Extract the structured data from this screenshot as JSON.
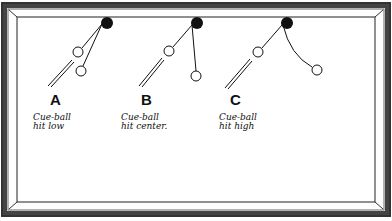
{
  "diagram": {
    "colors": {
      "ink": "#111111",
      "frame": "#555555",
      "cloth": "#ffffff"
    },
    "panels": [
      {
        "letter": "A",
        "caption_line1": "Cue-ball",
        "caption_line2": "hit low",
        "object_ball": [
          107,
          23
        ],
        "cue_ball_contact": [
          78,
          52
        ],
        "cue_ball_end": [
          81,
          71
        ],
        "path": "draw-back"
      },
      {
        "letter": "B",
        "caption_line1": "Cue-ball",
        "caption_line2": "hit center.",
        "object_ball": [
          197,
          23
        ],
        "cue_ball_contact": [
          169,
          51
        ],
        "cue_ball_end": [
          196,
          76
        ],
        "path": "stop-deflect"
      },
      {
        "letter": "C",
        "caption_line1": "Cue-ball",
        "caption_line2": "hit high",
        "object_ball": [
          287,
          23
        ],
        "cue_ball_contact": [
          258,
          52
        ],
        "cue_ball_end": [
          317,
          70
        ],
        "path": "follow-curve"
      }
    ]
  }
}
